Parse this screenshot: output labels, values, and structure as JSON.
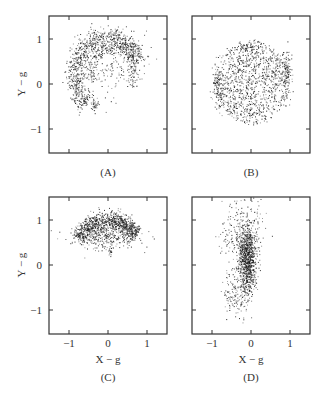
{
  "chart_data": [
    {
      "type": "scatter",
      "panel": "(A)",
      "xlabel": "",
      "ylabel": "Y − g",
      "xlim": [
        -1.5,
        1.5
      ],
      "ylim": [
        -1.5,
        1.5
      ],
      "xticks": [
        -1,
        0,
        1
      ],
      "yticks": [
        -1,
        0,
        1
      ],
      "xtick_labels_visible": false,
      "ytick_labels": [
        "1",
        "0",
        "−1"
      ],
      "description": "Points form an arc/partial ring of radius ~0.9 centered near (0,0.3), dense along upper-left edge from (-0.8,0) up to (0.2,1.05) and down to (0.8,0.6); sparse interior filaments; tail down to (-0.35,-0.6).",
      "clusters": [
        {
          "shape": "arc",
          "cx": 0.0,
          "cy": 0.2,
          "r": 0.85,
          "a0": 20,
          "a1": 230,
          "spread": 0.12,
          "n": 900
        },
        {
          "shape": "arc",
          "cx": 0.1,
          "cy": 0.25,
          "r": 0.55,
          "a0": 330,
          "a1": 200,
          "spread": 0.07,
          "n": 250
        },
        {
          "shape": "blob",
          "cx": -0.35,
          "cy": -0.45,
          "sx": 0.06,
          "sy": 0.08,
          "n": 40
        },
        {
          "shape": "blob",
          "cx": 0.1,
          "cy": 0.5,
          "sx": 0.45,
          "sy": 0.35,
          "n": 150
        }
      ]
    },
    {
      "type": "scatter",
      "panel": "(B)",
      "xlabel": "",
      "ylabel": "",
      "xlim": [
        -1.5,
        1.5
      ],
      "ylim": [
        -1.5,
        1.5
      ],
      "xticks": [
        -1,
        0,
        1
      ],
      "yticks": [
        -1,
        0,
        1
      ],
      "description": "Roughly uniform disk of radius ~0.95 centered at (0,0.05), denser at left and right edges near y≈0.",
      "clusters": [
        {
          "shape": "disk",
          "cx": 0.0,
          "cy": 0.05,
          "r": 0.92,
          "n": 1100
        },
        {
          "shape": "blob",
          "cx": -0.85,
          "cy": -0.05,
          "sx": 0.07,
          "sy": 0.25,
          "n": 120
        },
        {
          "shape": "blob",
          "cx": 0.9,
          "cy": 0.2,
          "sx": 0.07,
          "sy": 0.3,
          "n": 140
        },
        {
          "shape": "blob",
          "cx": -0.1,
          "cy": 0.85,
          "sx": 0.1,
          "sy": 0.05,
          "n": 40
        }
      ]
    },
    {
      "type": "scatter",
      "panel": "(C)",
      "xlabel": "X − g",
      "ylabel": "Y − g",
      "xlim": [
        -1.5,
        1.5
      ],
      "ylim": [
        -1.5,
        1.5
      ],
      "xticks": [
        -1,
        0,
        1
      ],
      "yticks": [
        -1,
        0,
        1
      ],
      "xtick_labels": [
        "−1",
        "0",
        "1"
      ],
      "ytick_labels": [
        "1",
        "0",
        "−1"
      ],
      "description": "Dense crescent/cap in upper region: spans x from -0.95 to 0.9, y from 0.35 to 1.1, densest along the top arc from (-0.8,0.6) to (0.3,1.05).",
      "clusters": [
        {
          "shape": "arc",
          "cx": 0.0,
          "cy": 0.05,
          "r": 0.95,
          "a0": 40,
          "a1": 145,
          "spread": 0.1,
          "n": 900
        },
        {
          "shape": "blob",
          "cx": -0.1,
          "cy": 0.65,
          "sx": 0.45,
          "sy": 0.14,
          "n": 350
        },
        {
          "shape": "blob",
          "cx": 0.05,
          "cy": 0.3,
          "sx": 0.02,
          "sy": 0.08,
          "n": 15
        }
      ]
    },
    {
      "type": "scatter",
      "panel": "(D)",
      "xlabel": "X − g",
      "ylabel": "",
      "xlim": [
        -1.5,
        1.5
      ],
      "ylim": [
        -1.5,
        1.5
      ],
      "xticks": [
        -1,
        0,
        1
      ],
      "yticks": [
        -1,
        0,
        1
      ],
      "xtick_labels": [
        "−1",
        "0",
        "1"
      ],
      "description": "Elongated vertical cloud tilted slightly; dense core centered near (-0.1,0.2) spanning y -0.5..0.6; sparse halo from (-0.9,0) up to (0.1,1.3) and down to (-0.6,-1.2).",
      "clusters": [
        {
          "shape": "blob",
          "cx": -0.1,
          "cy": 0.25,
          "sx": 0.12,
          "sy": 0.3,
          "n": 750
        },
        {
          "shape": "blob",
          "cx": -0.1,
          "cy": -0.25,
          "sx": 0.08,
          "sy": 0.25,
          "n": 200
        },
        {
          "shape": "blob",
          "cx": -0.2,
          "cy": 0.9,
          "sx": 0.25,
          "sy": 0.3,
          "n": 170
        },
        {
          "shape": "blob",
          "cx": -0.4,
          "cy": -0.7,
          "sx": 0.17,
          "sy": 0.25,
          "n": 130
        },
        {
          "shape": "blob",
          "cx": -0.5,
          "cy": 0.2,
          "sx": 0.2,
          "sy": 0.4,
          "n": 70
        }
      ]
    }
  ],
  "panels": [
    {
      "id": "A",
      "label": "(A)",
      "ylabel": "Y − g",
      "xlabel": "",
      "yticks": [
        "1",
        "0",
        "−1"
      ],
      "xticks": []
    },
    {
      "id": "B",
      "label": "(B)",
      "ylabel": "",
      "xlabel": "",
      "yticks": [],
      "xticks": []
    },
    {
      "id": "C",
      "label": "(C)",
      "ylabel": "Y − g",
      "xlabel": "X − g",
      "yticks": [
        "1",
        "0",
        "−1"
      ],
      "xticks": [
        "−1",
        "0",
        "1"
      ]
    },
    {
      "id": "D",
      "label": "(D)",
      "ylabel": "",
      "xlabel": "X − g",
      "yticks": [],
      "xticks": [
        "−1",
        "0",
        "1"
      ]
    }
  ],
  "style": {
    "point_color": "#1a1a1a",
    "frame_color": "#333333",
    "background": "#ffffff"
  }
}
